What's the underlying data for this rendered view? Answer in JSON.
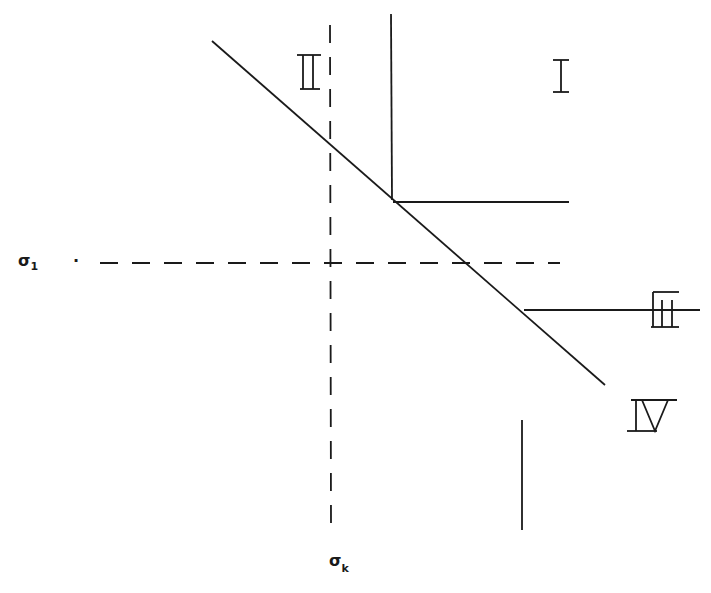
{
  "diagram": {
    "type": "stress-region-diagram",
    "axes": {
      "horizontal_label": "σ",
      "horizontal_subscript": "1",
      "vertical_label": "σ",
      "vertical_subscript": "k"
    },
    "regions": [
      {
        "id": "I",
        "label": "I"
      },
      {
        "id": "II",
        "label": "II"
      },
      {
        "id": "III",
        "label": "III"
      },
      {
        "id": "IV",
        "label": "IV"
      }
    ]
  }
}
